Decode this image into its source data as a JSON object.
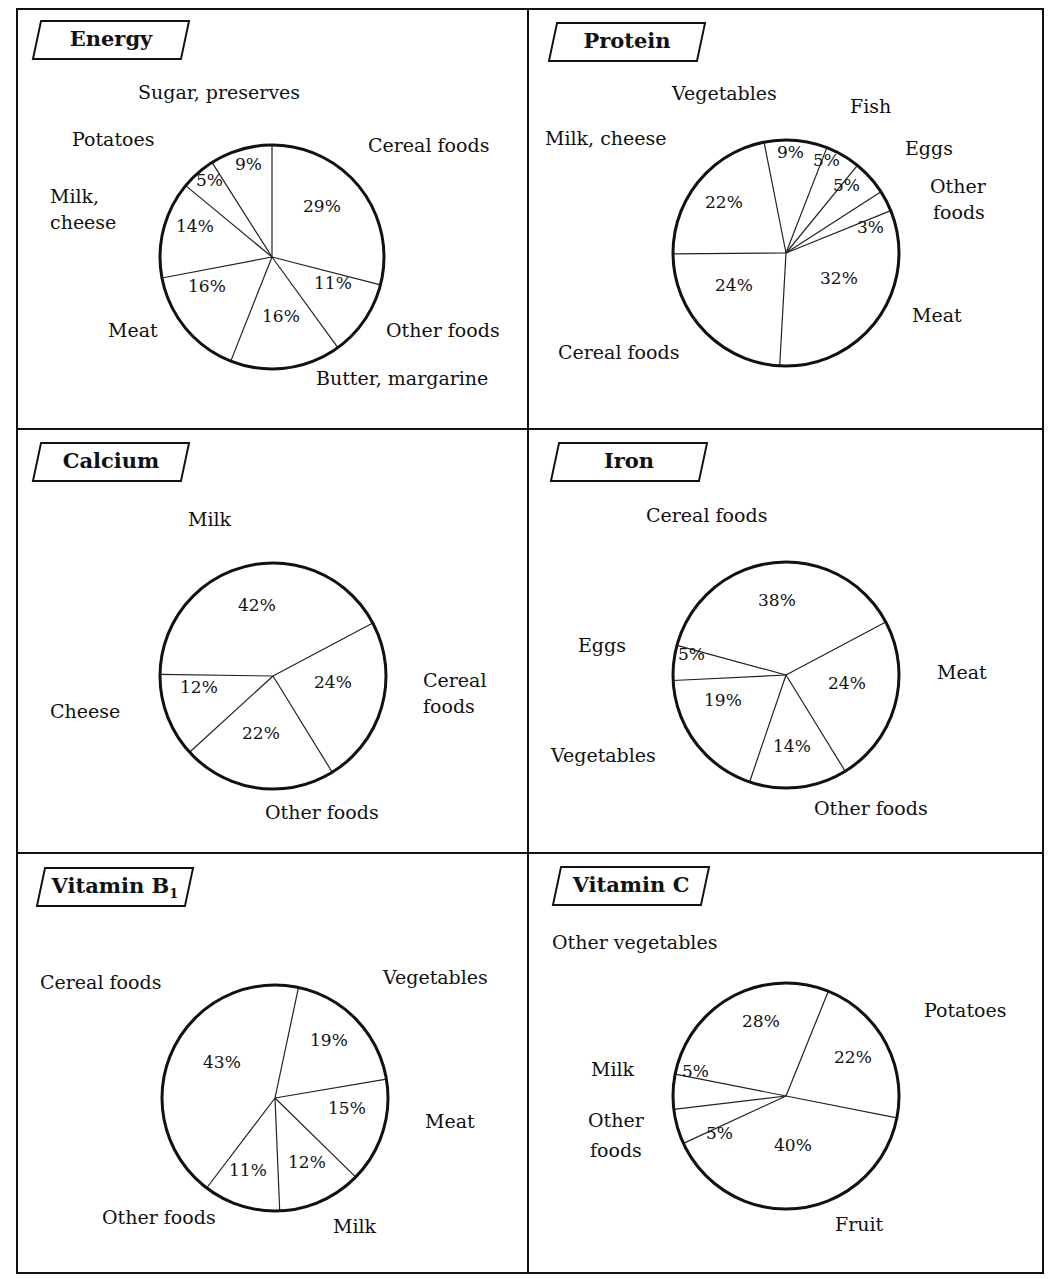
{
  "chart_data": [
    {
      "type": "pie",
      "title": "Energy",
      "categories": [
        "Cereal foods",
        "Other foods",
        "Butter, margarine",
        "Meat",
        "Milk, cheese",
        "Potatoes",
        "Sugar, preserves"
      ],
      "values": [
        29,
        11,
        16,
        16,
        14,
        5,
        9
      ],
      "start_angle_deg": 0,
      "direction": "clockwise",
      "center": [
        272,
        257
      ],
      "radius": 112
    },
    {
      "type": "pie",
      "title": "Protein",
      "categories": [
        "Meat",
        "Cereal foods",
        "Milk, cheese",
        "Vegetables",
        "Fish",
        "Eggs",
        "Other foods"
      ],
      "values": [
        32,
        24,
        22,
        9,
        5,
        5,
        3
      ],
      "start_angle_deg": 68,
      "direction": "clockwise",
      "center": [
        786,
        253
      ],
      "radius": 113
    },
    {
      "type": "pie",
      "title": "Calcium",
      "categories": [
        "Cereal foods",
        "Other foods",
        "Cheese",
        "Milk"
      ],
      "values": [
        24,
        22,
        12,
        42
      ],
      "start_angle_deg": 62,
      "direction": "clockwise",
      "center": [
        273,
        676
      ],
      "radius": 113
    },
    {
      "type": "pie",
      "title": "Iron",
      "categories": [
        "Meat",
        "Other foods",
        "Vegetables",
        "Eggs",
        "Cereal foods"
      ],
      "values": [
        24,
        14,
        19,
        5,
        38
      ],
      "start_angle_deg": 62,
      "direction": "clockwise",
      "center": [
        786,
        675
      ],
      "radius": 113
    },
    {
      "type": "pie",
      "title": "Vitamin B1",
      "categories": [
        "Vegetables",
        "Meat",
        "Milk",
        "Other foods",
        "Cereal foods"
      ],
      "values": [
        19,
        15,
        12,
        11,
        43
      ],
      "start_angle_deg": 12,
      "direction": "clockwise",
      "center": [
        275,
        1098
      ],
      "radius": 113
    },
    {
      "type": "pie",
      "title": "Vitamin C",
      "categories": [
        "Potatoes",
        "Fruit",
        "Other foods",
        "Milk",
        "Other vegetables"
      ],
      "values": [
        22,
        40,
        5,
        5,
        28
      ],
      "start_angle_deg": 22,
      "direction": "clockwise",
      "center": [
        786,
        1096
      ],
      "radius": 113
    }
  ],
  "panels": [
    {
      "title": "Energy",
      "subscript": "",
      "labels": [
        {
          "text": "Sugar, preserves",
          "x": 138,
          "y": 92
        },
        {
          "text": "Potatoes",
          "x": 72,
          "y": 139
        },
        {
          "text": "Milk,",
          "x": 50,
          "y": 196
        },
        {
          "text": "cheese",
          "x": 50,
          "y": 222
        },
        {
          "text": "Cereal foods",
          "x": 368,
          "y": 145
        },
        {
          "text": "Other foods",
          "x": 386,
          "y": 330
        },
        {
          "text": "Meat",
          "x": 108,
          "y": 330
        },
        {
          "text": "Butter, margarine",
          "x": 316,
          "y": 378
        }
      ],
      "pcts": [
        {
          "text": "29%",
          "x": 303,
          "y": 206
        },
        {
          "text": "11%",
          "x": 314,
          "y": 283
        },
        {
          "text": "16%",
          "x": 262,
          "y": 316
        },
        {
          "text": "16%",
          "x": 188,
          "y": 286
        },
        {
          "text": "14%",
          "x": 176,
          "y": 226
        },
        {
          "text": "5%",
          "x": 196,
          "y": 180
        },
        {
          "text": "9%",
          "x": 235,
          "y": 164
        }
      ]
    },
    {
      "title": "Protein",
      "subscript": "",
      "labels": [
        {
          "text": "Vegetables",
          "x": 672,
          "y": 93
        },
        {
          "text": "Fish",
          "x": 850,
          "y": 106
        },
        {
          "text": "Milk, cheese",
          "x": 545,
          "y": 138
        },
        {
          "text": "Eggs",
          "x": 905,
          "y": 148
        },
        {
          "text": "Other",
          "x": 930,
          "y": 186
        },
        {
          "text": "foods",
          "x": 933,
          "y": 212
        },
        {
          "text": "Meat",
          "x": 912,
          "y": 315
        },
        {
          "text": "Cereal foods",
          "x": 558,
          "y": 352
        }
      ],
      "pcts": [
        {
          "text": "9%",
          "x": 777,
          "y": 152
        },
        {
          "text": "5%",
          "x": 813,
          "y": 160
        },
        {
          "text": "5%",
          "x": 833,
          "y": 185
        },
        {
          "text": "3%",
          "x": 857,
          "y": 227
        },
        {
          "text": "32%",
          "x": 820,
          "y": 278
        },
        {
          "text": "24%",
          "x": 715,
          "y": 285
        },
        {
          "text": "22%",
          "x": 705,
          "y": 202
        }
      ]
    },
    {
      "title": "Calcium",
      "subscript": "",
      "labels": [
        {
          "text": "Milk",
          "x": 188,
          "y": 519
        },
        {
          "text": "Cereal",
          "x": 423,
          "y": 680
        },
        {
          "text": "foods",
          "x": 423,
          "y": 706
        },
        {
          "text": "Cheese",
          "x": 50,
          "y": 711
        },
        {
          "text": "Other foods",
          "x": 265,
          "y": 812
        }
      ],
      "pcts": [
        {
          "text": "42%",
          "x": 238,
          "y": 605
        },
        {
          "text": "24%",
          "x": 314,
          "y": 682
        },
        {
          "text": "12%",
          "x": 180,
          "y": 687
        },
        {
          "text": "22%",
          "x": 242,
          "y": 733
        }
      ]
    },
    {
      "title": "Iron",
      "subscript": "",
      "labels": [
        {
          "text": "Cereal foods",
          "x": 646,
          "y": 515
        },
        {
          "text": "Eggs",
          "x": 578,
          "y": 645
        },
        {
          "text": "Meat",
          "x": 937,
          "y": 672
        },
        {
          "text": "Vegetables",
          "x": 551,
          "y": 755
        },
        {
          "text": "Other foods",
          "x": 814,
          "y": 808
        }
      ],
      "pcts": [
        {
          "text": "38%",
          "x": 758,
          "y": 600
        },
        {
          "text": "5%",
          "x": 678,
          "y": 654
        },
        {
          "text": "24%",
          "x": 828,
          "y": 683
        },
        {
          "text": "19%",
          "x": 704,
          "y": 700
        },
        {
          "text": "14%",
          "x": 773,
          "y": 746
        }
      ]
    },
    {
      "title": "Vitamin B",
      "subscript": "1",
      "labels": [
        {
          "text": "Cereal foods",
          "x": 40,
          "y": 982
        },
        {
          "text": "Vegetables",
          "x": 383,
          "y": 977
        },
        {
          "text": "Meat",
          "x": 425,
          "y": 1121
        },
        {
          "text": "Other foods",
          "x": 102,
          "y": 1217
        },
        {
          "text": "Milk",
          "x": 333,
          "y": 1226
        }
      ],
      "pcts": [
        {
          "text": "19%",
          "x": 310,
          "y": 1040
        },
        {
          "text": "43%",
          "x": 203,
          "y": 1062
        },
        {
          "text": "15%",
          "x": 328,
          "y": 1108
        },
        {
          "text": "12%",
          "x": 288,
          "y": 1162
        },
        {
          "text": "11%",
          "x": 229,
          "y": 1170
        }
      ]
    },
    {
      "title": "Vitamin C",
      "subscript": "",
      "labels": [
        {
          "text": "Other vegetables",
          "x": 552,
          "y": 942
        },
        {
          "text": "Potatoes",
          "x": 924,
          "y": 1010
        },
        {
          "text": "Milk",
          "x": 591,
          "y": 1069
        },
        {
          "text": "Other",
          "x": 588,
          "y": 1120
        },
        {
          "text": "foods",
          "x": 590,
          "y": 1150
        },
        {
          "text": "Fruit",
          "x": 835,
          "y": 1224
        }
      ],
      "pcts": [
        {
          "text": "28%",
          "x": 742,
          "y": 1021
        },
        {
          "text": "22%",
          "x": 834,
          "y": 1057
        },
        {
          "text": "5%",
          "x": 682,
          "y": 1071
        },
        {
          "text": "5%",
          "x": 706,
          "y": 1133
        },
        {
          "text": "40%",
          "x": 774,
          "y": 1145
        }
      ]
    }
  ],
  "panel_boxes": [
    {
      "title_x": 36,
      "title_y": 20,
      "title_w": 150
    },
    {
      "title_x": 552,
      "title_y": 22,
      "title_w": 150
    },
    {
      "title_x": 36,
      "title_y": 442,
      "title_w": 150
    },
    {
      "title_x": 554,
      "title_y": 442,
      "title_w": 150
    },
    {
      "title_x": 40,
      "title_y": 867,
      "title_w": 150
    },
    {
      "title_x": 556,
      "title_y": 866,
      "title_w": 150
    }
  ]
}
